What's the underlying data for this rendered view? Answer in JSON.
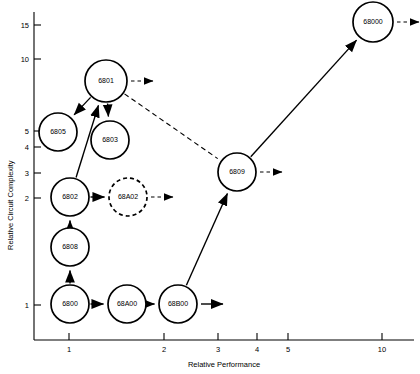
{
  "chart_data": {
    "type": "scatter",
    "title": "",
    "xlabel": "Relative Performance",
    "ylabel": "Relative Circuit Complexity",
    "xscale": "log",
    "yscale": "log",
    "grid": false,
    "legend": "none",
    "xticks": [
      {
        "label": "1",
        "px": 69
      },
      {
        "label": "2",
        "px": 164
      },
      {
        "label": "3",
        "px": 218
      },
      {
        "label": "4",
        "px": 257
      },
      {
        "label": "5",
        "px": 288
      },
      {
        "label": "10",
        "px": 382
      }
    ],
    "yticks": [
      {
        "label": "15",
        "py": 25
      },
      {
        "label": "10",
        "py": 59
      },
      {
        "label": "5",
        "py": 131
      },
      {
        "label": "4",
        "py": 147
      },
      {
        "label": "3",
        "py": 173
      },
      {
        "label": "2",
        "py": 198
      },
      {
        "label": "1",
        "py": 305
      }
    ],
    "nodes": [
      {
        "id": "6805",
        "label": "6805",
        "cx": 58,
        "cy": 132,
        "r": 19,
        "style": "solid",
        "x": 0.85,
        "y": 4.6
      },
      {
        "id": "6801",
        "label": "6801",
        "cx": 106,
        "cy": 81,
        "r": 21,
        "style": "solid",
        "x": 1.35,
        "y": 8.2
      },
      {
        "id": "6803",
        "label": "6803",
        "cx": 110,
        "cy": 140,
        "r": 19,
        "style": "solid",
        "x": 1.4,
        "y": 4.3
      },
      {
        "id": "6802",
        "label": "6802",
        "cx": 70,
        "cy": 197,
        "r": 19,
        "style": "solid",
        "x": 1.0,
        "y": 2.0
      },
      {
        "id": "68A02",
        "label": "68A02",
        "cx": 128,
        "cy": 197,
        "r": 19,
        "style": "dashed",
        "x": 1.55,
        "y": 2.0
      },
      {
        "id": "6808",
        "label": "6808",
        "cx": 70,
        "cy": 247,
        "r": 19,
        "style": "solid",
        "x": 1.0,
        "y": 1.4
      },
      {
        "id": "6800",
        "label": "6800",
        "cx": 70,
        "cy": 304,
        "r": 19,
        "style": "solid",
        "x": 1.0,
        "y": 1.0
      },
      {
        "id": "68A00",
        "label": "68A00",
        "cx": 127,
        "cy": 304,
        "r": 19,
        "style": "solid",
        "x": 1.5,
        "y": 1.0
      },
      {
        "id": "68B00",
        "label": "68B00",
        "cx": 178,
        "cy": 304,
        "r": 19,
        "style": "solid",
        "x": 2.2,
        "y": 1.0
      },
      {
        "id": "6809",
        "label": "6809",
        "cx": 237,
        "cy": 172,
        "r": 19,
        "style": "solid",
        "x": 3.3,
        "y": 2.3
      },
      {
        "id": "68000",
        "label": "68000",
        "cx": 373,
        "cy": 22,
        "r": 20,
        "style": "solid",
        "x": 9.5,
        "y": 15.5
      }
    ],
    "edges": [
      {
        "from": "6800",
        "to": "6808",
        "style": "solid"
      },
      {
        "from": "6808",
        "to": "6802",
        "style": "solid"
      },
      {
        "from": "6802",
        "to": "6801",
        "style": "solid"
      },
      {
        "from": "6802",
        "to": "68A02",
        "style": "solid"
      },
      {
        "from": "6801",
        "to": "6805",
        "style": "solid"
      },
      {
        "from": "6801",
        "to": "6803",
        "style": "solid"
      },
      {
        "from": "6800",
        "to": "68A00",
        "style": "solid"
      },
      {
        "from": "68A00",
        "to": "68B00",
        "style": "solid"
      },
      {
        "from": "68B00",
        "to": "6809",
        "style": "solid"
      },
      {
        "from": "6809",
        "to": "68000",
        "style": "solid"
      },
      {
        "from": "6801",
        "to": "6809",
        "style": "dashed"
      }
    ],
    "open_arrows": [
      {
        "from": "6801",
        "style": "dashed",
        "direction": "right"
      },
      {
        "from": "68A02",
        "style": "dashed",
        "direction": "right"
      },
      {
        "from": "68B00",
        "style": "solid",
        "direction": "right"
      },
      {
        "from": "6809",
        "style": "dashed",
        "direction": "right"
      },
      {
        "from": "68000",
        "style": "dashed",
        "direction": "right"
      }
    ]
  }
}
